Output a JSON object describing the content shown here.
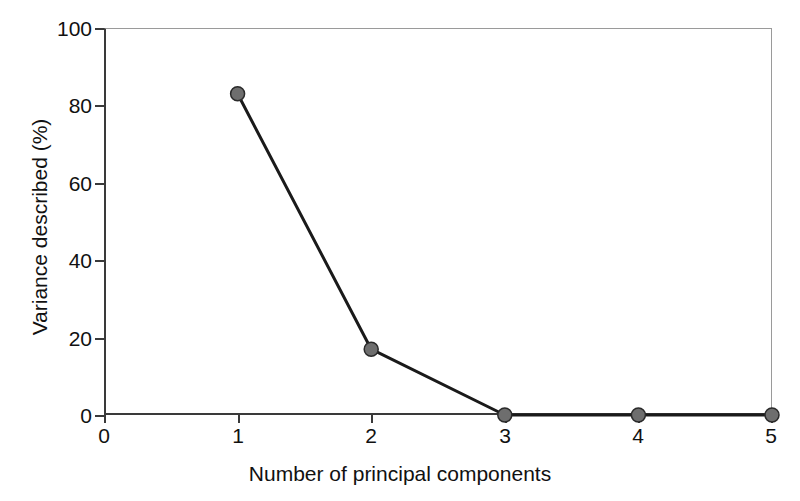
{
  "chart_data": {
    "type": "line",
    "title": "",
    "subtitle": "",
    "xlabel": "Number of principal components",
    "ylabel": "Variance described (%)",
    "x": [
      1,
      2,
      3,
      4,
      5
    ],
    "values": [
      83,
      17,
      0,
      0,
      0
    ],
    "series": [
      {
        "name": "Variance described",
        "x": [
          1,
          2,
          3,
          4,
          5
        ],
        "values": [
          83,
          17,
          0,
          0,
          0
        ]
      }
    ],
    "xlim": [
      0,
      5
    ],
    "ylim": [
      0,
      100
    ],
    "xticks": [
      "0",
      "1",
      "2",
      "3",
      "4",
      "5"
    ],
    "xtick_values": [
      0,
      1,
      2,
      3,
      4,
      5
    ],
    "yticks": [
      "0",
      "20",
      "40",
      "60",
      "80",
      "100"
    ],
    "ytick_values": [
      0,
      20,
      40,
      60,
      80,
      100
    ],
    "grid": false,
    "legend": "none",
    "marker": "circle",
    "marker_color": "#6e6e6e",
    "marker_edge_color": "#2a2a2a",
    "line_color": "#1a1a1a",
    "line_width": 3,
    "annotations": []
  },
  "figure": {
    "background_color": "#ffffff",
    "axis_color": "#3a3a3a",
    "frame_color": "#9a9a9a",
    "text_color": "#111111"
  }
}
